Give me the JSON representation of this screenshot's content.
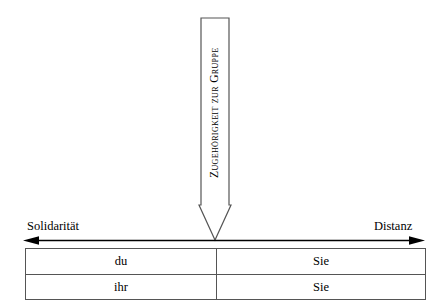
{
  "diagram": {
    "title_vertical": "Zugehörigkeit zur Gruppe",
    "axis": {
      "left_label": "Solidarität",
      "right_label": "Distanz",
      "left_arrow_icon": "arrow-left-icon",
      "right_arrow_icon": "arrow-right-icon"
    },
    "vertical_arrow": {
      "icon": "arrow-down-icon",
      "direction": "down"
    },
    "table": {
      "columns": [
        "informal",
        "formal"
      ],
      "rows": [
        {
          "informal": "du",
          "formal": "Sie"
        },
        {
          "informal": "ihr",
          "formal": "Sie"
        }
      ]
    },
    "colors": {
      "background": "#ffffff",
      "stroke": "#555555",
      "text": "#000000",
      "arrow_fill": "#000000"
    }
  }
}
